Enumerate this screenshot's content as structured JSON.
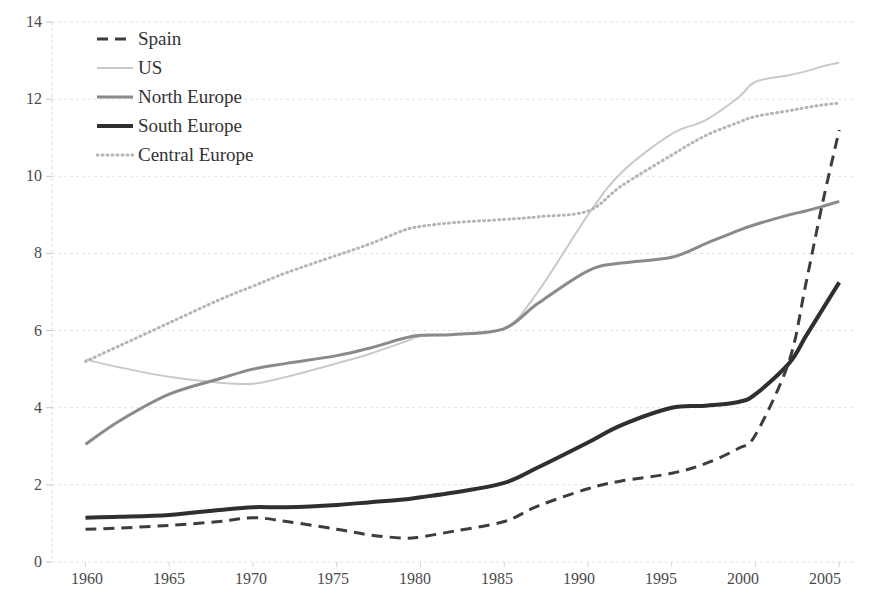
{
  "chart_data": {
    "type": "line",
    "title": "",
    "xlabel": "",
    "ylabel": "",
    "xlim": [
      1958,
      2006
    ],
    "ylim": [
      0,
      14
    ],
    "ytick_step": 2,
    "grid": true,
    "grid_axis": "y",
    "legend_position": "top-left",
    "xticks": [
      "1960",
      "1965",
      "1970",
      "1975",
      "1980",
      "1985",
      "1990",
      "1995",
      "2000",
      "2005"
    ],
    "xtick_values": [
      1960,
      1965,
      1970,
      1975,
      1980,
      1985,
      1990,
      1995,
      2000,
      2005
    ],
    "yticks": [
      "0",
      "2",
      "4",
      "6",
      "8",
      "10",
      "12",
      "14"
    ],
    "ytick_values": [
      0,
      2,
      4,
      6,
      8,
      10,
      12,
      14
    ],
    "x": [
      1960,
      1962,
      1965,
      1968,
      1970,
      1972,
      1975,
      1977,
      1979,
      1980,
      1982,
      1985,
      1987,
      1990,
      1992,
      1995,
      1997,
      1999,
      2000,
      2002,
      2003,
      2004,
      2005
    ],
    "series": [
      {
        "name": "Spain",
        "style": "dashed",
        "color": "#3d3d3d",
        "width": 3,
        "dash": "11,7",
        "values": [
          0.85,
          0.88,
          0.95,
          1.05,
          1.15,
          1.05,
          0.85,
          0.7,
          0.62,
          0.65,
          0.8,
          1.05,
          1.45,
          1.9,
          2.1,
          2.3,
          2.55,
          2.95,
          3.3,
          5.2,
          7.2,
          9.3,
          11.2
        ]
      },
      {
        "name": "US",
        "style": "solid-thin-light",
        "color": "#c9c9c9",
        "width": 2,
        "dash": "",
        "values": [
          5.25,
          5.05,
          4.8,
          4.65,
          4.62,
          4.8,
          5.15,
          5.4,
          5.7,
          5.85,
          5.9,
          6.05,
          7.0,
          9.0,
          10.1,
          11.1,
          11.45,
          12.05,
          12.45,
          12.62,
          12.72,
          12.85,
          12.95
        ]
      },
      {
        "name": "North Europe",
        "style": "solid-medium",
        "color": "#8a8a8a",
        "width": 3,
        "dash": "",
        "values": [
          3.05,
          3.65,
          4.35,
          4.75,
          5.0,
          5.15,
          5.35,
          5.55,
          5.8,
          5.88,
          5.9,
          6.05,
          6.7,
          7.55,
          7.75,
          7.9,
          8.25,
          8.6,
          8.75,
          9.0,
          9.1,
          9.22,
          9.35
        ]
      },
      {
        "name": "South Europe",
        "style": "solid-thick-dark",
        "color": "#2f2f2f",
        "width": 4,
        "dash": "",
        "values": [
          1.15,
          1.17,
          1.22,
          1.35,
          1.42,
          1.42,
          1.48,
          1.55,
          1.62,
          1.68,
          1.8,
          2.05,
          2.45,
          3.1,
          3.55,
          4.0,
          4.05,
          4.15,
          4.35,
          5.15,
          5.85,
          6.55,
          7.25
        ]
      },
      {
        "name": "Central Europe",
        "style": "dotted",
        "color": "#b5b5b5",
        "width": 3,
        "dash": "1,4",
        "values": [
          5.2,
          5.6,
          6.2,
          6.8,
          7.15,
          7.5,
          7.95,
          8.25,
          8.6,
          8.7,
          8.8,
          8.88,
          8.95,
          9.1,
          9.75,
          10.55,
          11.05,
          11.4,
          11.55,
          11.7,
          11.78,
          11.85,
          11.9
        ]
      }
    ]
  },
  "legend": {
    "items": [
      {
        "label": "Spain"
      },
      {
        "label": "US"
      },
      {
        "label": "North Europe"
      },
      {
        "label": "South Europe"
      },
      {
        "label": "Central Europe"
      }
    ]
  },
  "axes": {
    "x_labels": [
      "1960",
      "1965",
      "1970",
      "1975",
      "1980",
      "1985",
      "1990",
      "1995",
      "2000",
      "2005"
    ],
    "y_labels": [
      "14",
      "12",
      "10",
      "8",
      "6",
      "4",
      "2",
      "0"
    ]
  }
}
